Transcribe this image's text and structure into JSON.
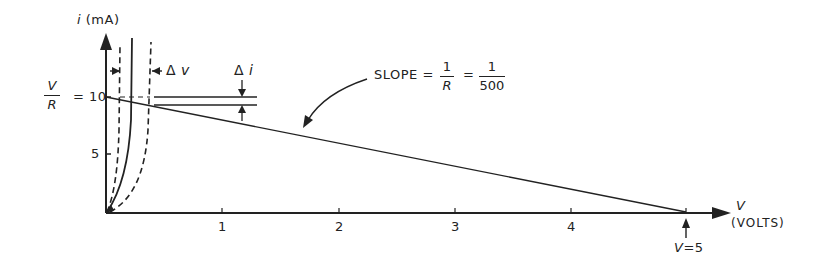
{
  "diagram": {
    "type": "current-voltage load line diagram",
    "y_axis": {
      "label_var": "i",
      "label_unit": "(mA)",
      "ticks": [
        {
          "value": 5,
          "label": "5"
        },
        {
          "value": 10,
          "label": "10"
        }
      ],
      "v_over_r": {
        "numerator": "V",
        "denominator": "R",
        "equals": "= 10"
      }
    },
    "x_axis": {
      "label_var": "V",
      "label_unit": "(VOLTS)",
      "ticks": [
        {
          "value": 1,
          "label": "1"
        },
        {
          "value": 2,
          "label": "2"
        },
        {
          "value": 3,
          "label": "3"
        },
        {
          "value": 4,
          "label": "4"
        }
      ],
      "endpoint_annotation": {
        "var": "V",
        "equals": "=5"
      }
    },
    "annotations": {
      "delta_v": {
        "symbol": "Δ",
        "var": "v"
      },
      "delta_i": {
        "symbol": "Δ",
        "var": "i"
      },
      "slope": {
        "text": "SLOPE =",
        "frac1_num": "1",
        "frac1_den": "R",
        "eq2": "=",
        "frac2_num": "1",
        "frac2_den": "500"
      }
    },
    "curves": [
      {
        "name": "diode-characteristic-nominal",
        "style": "solid"
      },
      {
        "name": "diode-characteristic-shifted-left",
        "style": "dashed"
      },
      {
        "name": "diode-characteristic-shifted-right",
        "style": "dashed"
      },
      {
        "name": "load-line",
        "style": "solid",
        "from": [
          0,
          10
        ],
        "to": [
          5,
          0
        ]
      }
    ],
    "colors": {
      "ink": "#222222",
      "background": "#ffffff"
    }
  }
}
